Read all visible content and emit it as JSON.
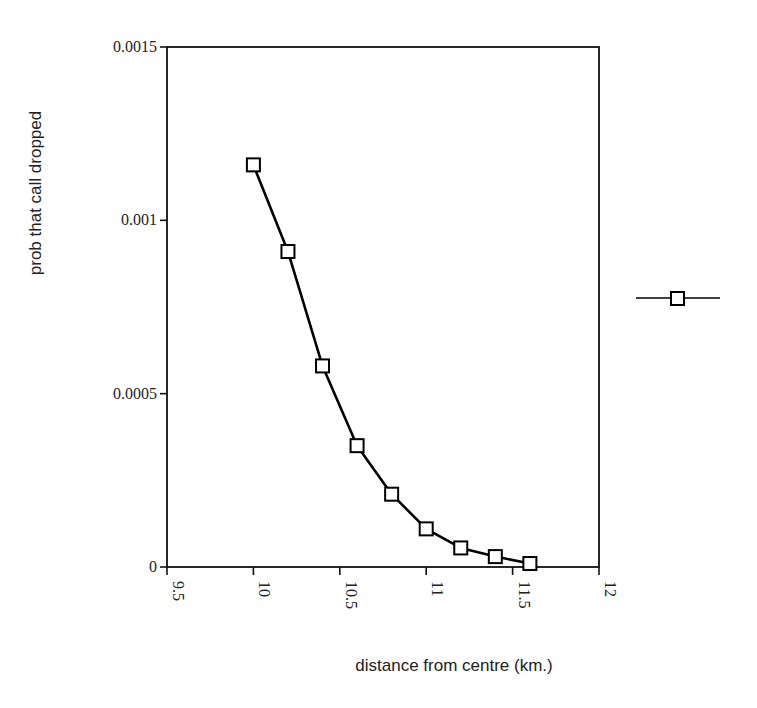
{
  "chart_data": {
    "type": "line",
    "title": "",
    "xlabel": "distance from centre (km.)",
    "ylabel": "prob that call dropped",
    "xlim": [
      9.5,
      12
    ],
    "ylim": [
      0,
      0.0015
    ],
    "x_ticks": [
      "9.5",
      "10",
      "10.5",
      "11",
      "11.5",
      "12"
    ],
    "y_ticks": [
      "0",
      "0.0005",
      "0.001",
      "0.0015"
    ],
    "grid": false,
    "legend_position": "right",
    "series": [
      {
        "name": "",
        "marker": "square",
        "color": "#000000",
        "x": [
          10.0,
          10.2,
          10.4,
          10.6,
          10.8,
          11.0,
          11.2,
          11.4,
          11.6
        ],
        "y": [
          0.00116,
          0.00091,
          0.00058,
          0.00035,
          0.00021,
          0.00011,
          5.5e-05,
          3e-05,
          1e-05
        ]
      }
    ]
  },
  "colors": {
    "line": "#000000",
    "marker_fill": "#ffffff",
    "background": "#ffffff",
    "text": "#222222"
  }
}
